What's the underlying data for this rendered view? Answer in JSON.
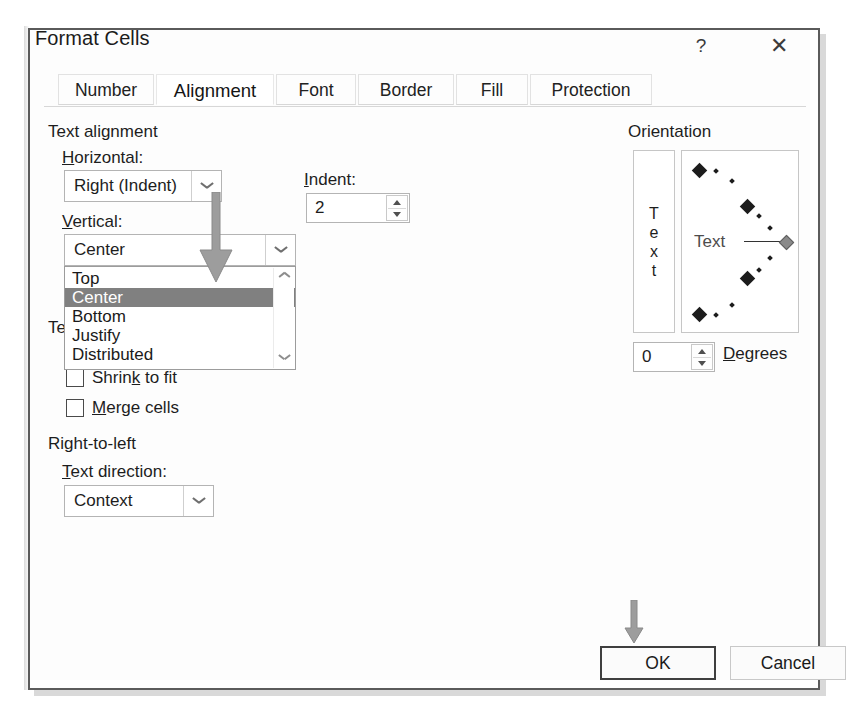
{
  "dialog": {
    "title": "Format Cells",
    "help_icon": "question-mark-icon",
    "close_icon": "close-icon"
  },
  "tabs": [
    {
      "label": "Number",
      "active": false
    },
    {
      "label": "Alignment",
      "active": true
    },
    {
      "label": "Font",
      "active": false
    },
    {
      "label": "Border",
      "active": false
    },
    {
      "label": "Fill",
      "active": false
    },
    {
      "label": "Protection",
      "active": false
    }
  ],
  "text_alignment": {
    "section_title": "Text alignment",
    "horizontal": {
      "label": "Horizontal:",
      "accelerator": "H",
      "value": "Right (Indent)"
    },
    "indent": {
      "label": "Indent:",
      "accelerator": "I",
      "value": "2"
    },
    "vertical": {
      "label": "Vertical:",
      "accelerator": "V",
      "value": "Center",
      "open": true,
      "options": [
        {
          "label": "Top",
          "selected": false
        },
        {
          "label": "Center",
          "selected": true
        },
        {
          "label": "Bottom",
          "selected": false
        },
        {
          "label": "Justify",
          "selected": false
        },
        {
          "label": "Distributed",
          "selected": false
        }
      ]
    }
  },
  "text_control": {
    "section_title": "Text control",
    "occluded_fragment": "Te",
    "checkboxes": [
      {
        "label": "Shrink to fit",
        "checked": false
      },
      {
        "label": "Merge cells",
        "checked": false
      }
    ]
  },
  "right_to_left": {
    "section_title": "Right-to-left",
    "text_direction": {
      "label": "Text direction:",
      "accelerator": "T",
      "value": "Context"
    }
  },
  "orientation": {
    "section_title": "Orientation",
    "vertical_text_letters": [
      "T",
      "e",
      "x",
      "t"
    ],
    "dial_text": "Text",
    "degrees": {
      "value": "0",
      "label": "Degrees",
      "accelerator": "D"
    }
  },
  "buttons": {
    "ok": "OK",
    "cancel": "Cancel"
  },
  "annotations": {
    "arrow_to_vertical_dropdown": "down-arrow-annotation",
    "arrow_to_ok_button": "down-arrow-annotation"
  },
  "colors": {
    "selection_bg": "#808080",
    "selection_fg": "#ffffff",
    "dialog_border": "#5a5a5a",
    "annotation_arrow": "#9a9a9a"
  }
}
